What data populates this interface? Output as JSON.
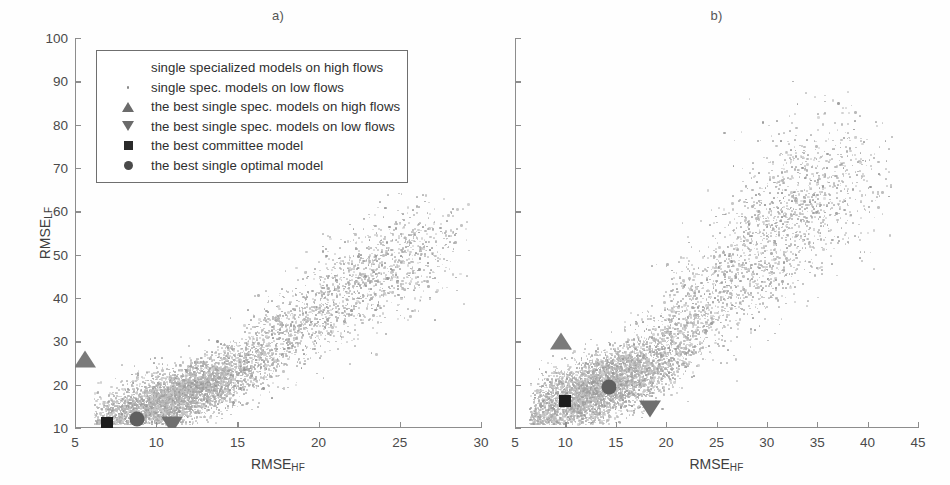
{
  "figure": {
    "panels": [
      {
        "id": "a",
        "title": "a)",
        "xlabel": "RMSE",
        "xlabel_sub": "HF",
        "ylabel": "RMSE",
        "ylabel_sub": "LF",
        "xlim": [
          5,
          30
        ],
        "ylim": [
          10,
          100
        ],
        "xticks": [
          5,
          10,
          15,
          20,
          25,
          30
        ],
        "yticks": [
          10,
          20,
          30,
          40,
          50,
          60,
          70,
          80,
          90,
          100
        ],
        "show_ytick_labels": true
      },
      {
        "id": "b",
        "title": "b)",
        "xlabel": "RMSE",
        "xlabel_sub": "HF",
        "ylabel": "",
        "ylabel_sub": "",
        "xlim": [
          5,
          45
        ],
        "ylim": [
          10,
          100
        ],
        "xticks": [
          5,
          10,
          15,
          20,
          25,
          30,
          35,
          40,
          45
        ],
        "yticks": [
          10,
          20,
          30,
          40,
          50,
          60,
          70,
          80,
          90,
          100
        ],
        "show_ytick_labels": false
      }
    ]
  },
  "legend": {
    "position": "upper-left-inside-panel-a",
    "entries": [
      {
        "marker": "blank",
        "label": "single specialized  models on high flows"
      },
      {
        "marker": "dot",
        "label": "single spec. models on low flows"
      },
      {
        "marker": "triangle-up",
        "label": "the best single spec. models on high flows"
      },
      {
        "marker": "triangle-down",
        "label": "the best single spec. models on low flows"
      },
      {
        "marker": "square",
        "label": "the best committee model"
      },
      {
        "marker": "circle",
        "label": "the best single optimal model"
      }
    ]
  },
  "colors": {
    "scatter_cloud": "#a8a8a8",
    "scatter_cloud_dense": "#9a9a9a",
    "scatter_sparse": "#b8b8b8",
    "marker_triangle_up": "#7a7a7a",
    "marker_triangle_down": "#6f6f6f",
    "marker_square": "#1d1d1d",
    "marker_circle": "#5f5f5f",
    "axis": "#8d8d8d",
    "text": "#3a3a3a",
    "background": "#ffffff"
  },
  "chart_data": {
    "type": "scatter",
    "title": "",
    "xlabel": "RMSE_HF",
    "ylabel": "RMSE_LF",
    "grid": false,
    "legend_position": "upper left (panel a)",
    "panels": [
      {
        "id": "a",
        "label": "a)",
        "xlim": [
          5,
          30
        ],
        "ylim": [
          10,
          100
        ],
        "xticks": [
          5,
          10,
          15,
          20,
          25,
          30
        ],
        "yticks": [
          10,
          20,
          30,
          40,
          50,
          60,
          70,
          80,
          90,
          100
        ],
        "series": [
          {
            "name": "single spec. models on low flows",
            "marker": "dot",
            "color": "#a8a8a8",
            "n_points": 6000,
            "description": "Dense comet-shaped cloud; dense core near RMSE_HF 8-14 with RMSE_LF 11-25, trailing upward-right tail reaching RMSE_HF ~29 and RMSE_LF ~65",
            "cloud_model": {
              "core_center": [
                11.0,
                17.0
              ],
              "core_spread": [
                2.6,
                5.0
              ],
              "tail_start": [
                9.0,
                14.0
              ],
              "tail_end": [
                27.0,
                55.0
              ],
              "tail_spread": [
                1.6,
                6.5
              ],
              "x_range_observed": [
                6.2,
                29.3
              ],
              "y_range_observed": [
                10.2,
                65.0
              ]
            }
          }
        ],
        "highlighted_points": [
          {
            "name": "the best single spec. models on high flows",
            "marker": "triangle-up",
            "x": 5.6,
            "y": 26.0
          },
          {
            "name": "the best committee model",
            "marker": "square",
            "x": 7.0,
            "y": 11.2
          },
          {
            "name": "the best single optimal model",
            "marker": "circle",
            "x": 8.8,
            "y": 12.0
          },
          {
            "name": "the best single spec. models on low flows",
            "marker": "triangle-down",
            "x": 11.0,
            "y": 10.6
          }
        ]
      },
      {
        "id": "b",
        "label": "b)",
        "xlim": [
          5,
          45
        ],
        "ylim": [
          10,
          100
        ],
        "xticks": [
          5,
          10,
          15,
          20,
          25,
          30,
          35,
          40,
          45
        ],
        "yticks": [
          10,
          20,
          30,
          40,
          50,
          60,
          70,
          80,
          90,
          100
        ],
        "series": [
          {
            "name": "single spec. models on low flows",
            "marker": "dot",
            "color": "#a8a8a8",
            "n_points": 6500,
            "description": "Dense comet-shaped cloud; dense core near RMSE_HF 8-17 with RMSE_LF 11-30, broad upward-right tail reaching RMSE_HF ~42 and RMSE_LF ~90",
            "cloud_model": {
              "core_center": [
                13.0,
                19.0
              ],
              "core_spread": [
                4.0,
                6.0
              ],
              "tail_start": [
                11.0,
                15.0
              ],
              "tail_end": [
                38.0,
                72.0
              ],
              "tail_spread": [
                3.0,
                10.0
              ],
              "x_range_observed": [
                6.5,
                42.5
              ],
              "y_range_observed": [
                10.3,
                90.0
              ]
            }
          }
        ],
        "highlighted_points": [
          {
            "name": "the best single spec. models on high flows",
            "marker": "triangle-up",
            "x": 9.6,
            "y": 30.0
          },
          {
            "name": "the best committee model",
            "marker": "square",
            "x": 10.0,
            "y": 16.2
          },
          {
            "name": "the best single optimal model",
            "marker": "circle",
            "x": 14.3,
            "y": 19.5
          },
          {
            "name": "the best single spec. models on low flows",
            "marker": "triangle-down",
            "x": 18.4,
            "y": 14.5
          }
        ]
      }
    ]
  }
}
